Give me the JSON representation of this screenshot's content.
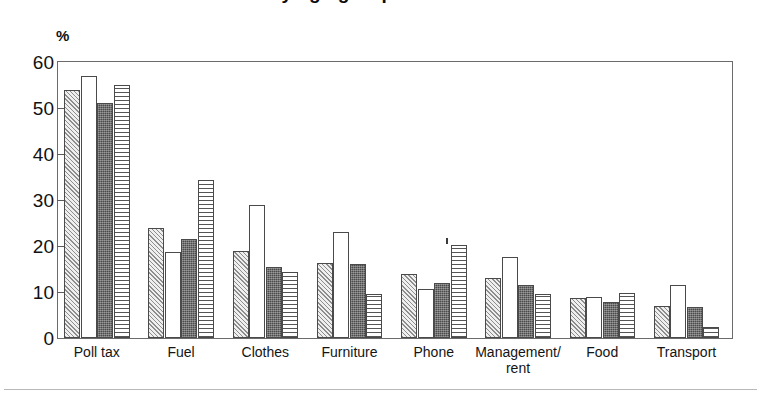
{
  "title": {
    "text": "…by age group",
    "note": "title is cropped off the top edge of the screenshot"
  },
  "axis": {
    "y_unit_label": "%",
    "y_ticks": [
      "0",
      "10",
      "20",
      "30",
      "40",
      "50",
      "60"
    ]
  },
  "categories_display": [
    "Poll tax",
    "Fuel",
    "Clothes",
    "Furniture",
    "Phone",
    "Management/\nrent",
    "Food",
    "Transport"
  ],
  "chart_data": {
    "type": "bar",
    "title": "…by age group",
    "xlabel": "",
    "ylabel": "%",
    "ylim": [
      0,
      60
    ],
    "ytick_step": 10,
    "grid": false,
    "legend": "none",
    "categories": [
      "Poll tax",
      "Fuel",
      "Clothes",
      "Furniture",
      "Phone",
      "Management/rent",
      "Food",
      "Transport"
    ],
    "series": [
      {
        "name": "Series 1",
        "pattern": "diagonal-hatch-light",
        "values": [
          54,
          24,
          19,
          16.3,
          14,
          13,
          8.8,
          7
        ]
      },
      {
        "name": "Series 2",
        "pattern": "white-empty",
        "values": [
          57,
          18.7,
          29,
          23,
          10.7,
          17.7,
          9,
          11.5
        ]
      },
      {
        "name": "Series 3",
        "pattern": "dark-solid-stipple",
        "values": [
          51,
          21.5,
          15.5,
          16,
          12,
          11.5,
          7.8,
          6.7
        ]
      },
      {
        "name": "Series 4",
        "pattern": "horizontal-lines",
        "values": [
          55,
          34.3,
          14.3,
          9.5,
          20.3,
          9.6,
          9.7,
          2.5
        ]
      }
    ]
  },
  "colors": {
    "frame": "#6b6b6b",
    "series1": "#e8e8e8",
    "series2": "#ffffff",
    "series3": "#4a4a4a",
    "series4": "#ffffff",
    "text": "#111111"
  }
}
